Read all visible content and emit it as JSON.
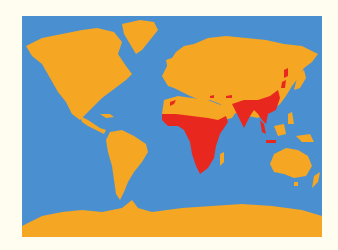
{
  "map": {
    "type": "world distribution map",
    "projection": "equirectangular-like",
    "colors": {
      "background": "#fffdf0",
      "ocean": "#4a90d0",
      "land": "#f5a623",
      "range": "#e8281e"
    },
    "legend": [],
    "highlighted_regions": [
      "Sub-Saharan Africa",
      "Arabian Peninsula (southwest coast)",
      "Indian subcontinent",
      "Southeast Asia (Indochina)",
      "Southern China",
      "Java",
      "Northeast China (scattered)",
      "North Africa / Middle East (scattered patches)"
    ]
  }
}
